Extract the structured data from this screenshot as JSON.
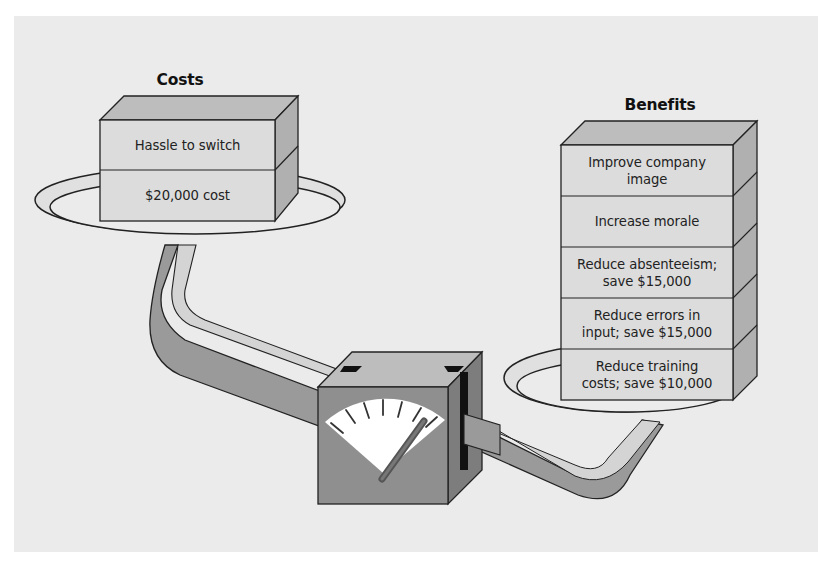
{
  "diagram": {
    "type": "balance-scale",
    "costs": {
      "title": "Costs",
      "items": [
        "Hassle to switch",
        "$20,000 cost"
      ]
    },
    "benefits": {
      "title": "Benefits",
      "items": [
        "Improve company image",
        "Increase morale",
        "Reduce absenteeism; save $15,000",
        "Reduce errors in input; save $15,000",
        "Reduce training costs; save $10,000"
      ],
      "lines": [
        [
          "Improve company",
          "image"
        ],
        [
          "Increase morale"
        ],
        [
          "Reduce absenteeism;",
          "save $15,000"
        ],
        [
          "Reduce errors in",
          "input; save $15,000"
        ],
        [
          "Reduce training",
          "costs; save $10,000"
        ]
      ]
    },
    "gauge": {
      "tick_count": 7,
      "needle_position": "right (tilted toward benefits)"
    },
    "colors": {
      "background": "#ebebeb",
      "box_face": "#dcdcdc",
      "box_top": "#bdbdbd",
      "box_side": "#b0b0b0",
      "pipe": "#9a9a9a",
      "pipe_highlight": "#d4d4d4",
      "gauge_body": "#8f8f8f",
      "dial": "#ffffff",
      "outline": "#222222"
    }
  }
}
